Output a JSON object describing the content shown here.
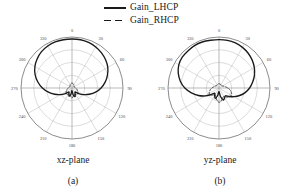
{
  "figure": {
    "legend": [
      {
        "label": "Gain_LHCP",
        "style": "solid",
        "color": "#1a1a1a",
        "key": "legend-solid-line"
      },
      {
        "label": "Gain_RHCP",
        "style": "dashed",
        "color": "#1a1a1a",
        "key": "legend-dashed-line"
      }
    ],
    "panels": [
      {
        "id": "a",
        "plane": "xz-plane",
        "index": "(a)"
      },
      {
        "id": "b",
        "plane": "yz-plane",
        "index": "(b)"
      }
    ]
  },
  "chart_data": [
    {
      "type": "line",
      "subtype": "polar",
      "title": "xz-plane",
      "panel": "(a)",
      "xlabel": "",
      "ylabel": "",
      "grid": true,
      "legend_position": "top-center",
      "angle_unit": "degrees",
      "angle_ticks": [
        0,
        30,
        60,
        90,
        120,
        150,
        180,
        210,
        240,
        270,
        300,
        330
      ],
      "angle_tick_labels": [
        "0",
        "30",
        "60",
        "90",
        "120",
        "150",
        "180",
        "210",
        "240",
        "270",
        "300",
        "330"
      ],
      "radial_rings": 4,
      "radial_range": [
        0,
        1
      ],
      "series": [
        {
          "name": "Gain_LHCP",
          "style": "solid",
          "color": "#1a1a1a",
          "angles": [
            0,
            10,
            20,
            30,
            40,
            50,
            60,
            70,
            80,
            90,
            100,
            110,
            120,
            130,
            140,
            150,
            160,
            170,
            180,
            190,
            200,
            210,
            220,
            230,
            240,
            250,
            260,
            270,
            280,
            290,
            300,
            310,
            320,
            330,
            340,
            350
          ],
          "values": [
            0.96,
            0.96,
            0.95,
            0.93,
            0.9,
            0.86,
            0.81,
            0.74,
            0.66,
            0.57,
            0.47,
            0.36,
            0.26,
            0.17,
            0.1,
            0.12,
            0.18,
            0.14,
            0.05,
            0.13,
            0.17,
            0.12,
            0.1,
            0.17,
            0.26,
            0.36,
            0.47,
            0.58,
            0.68,
            0.77,
            0.84,
            0.89,
            0.93,
            0.95,
            0.96,
            0.96
          ]
        },
        {
          "name": "Gain_RHCP",
          "style": "dashed",
          "color": "#2b2b2b",
          "angles": [
            0,
            10,
            20,
            30,
            40,
            50,
            60,
            70,
            80,
            90,
            100,
            110,
            120,
            130,
            140,
            150,
            160,
            170,
            180,
            190,
            200,
            210,
            220,
            230,
            240,
            250,
            260,
            270,
            280,
            290,
            300,
            310,
            320,
            330,
            340,
            350
          ],
          "values": [
            0.1,
            0.09,
            0.08,
            0.07,
            0.06,
            0.05,
            0.05,
            0.05,
            0.06,
            0.07,
            0.09,
            0.11,
            0.13,
            0.15,
            0.16,
            0.15,
            0.13,
            0.16,
            0.2,
            0.16,
            0.13,
            0.15,
            0.16,
            0.15,
            0.13,
            0.11,
            0.09,
            0.07,
            0.06,
            0.05,
            0.05,
            0.05,
            0.06,
            0.07,
            0.08,
            0.09
          ]
        }
      ]
    },
    {
      "type": "line",
      "subtype": "polar",
      "title": "yz-plane",
      "panel": "(b)",
      "xlabel": "",
      "ylabel": "",
      "grid": true,
      "legend_position": "top-center",
      "angle_unit": "degrees",
      "angle_ticks": [
        0,
        30,
        60,
        90,
        120,
        150,
        180,
        210,
        240,
        270,
        300,
        330
      ],
      "angle_tick_labels": [
        "0",
        "30",
        "60",
        "90",
        "120",
        "150",
        "180",
        "210",
        "240",
        "270",
        "300",
        "330"
      ],
      "radial_rings": 4,
      "radial_range": [
        0,
        1
      ],
      "series": [
        {
          "name": "Gain_LHCP",
          "style": "solid",
          "color": "#1a1a1a",
          "angles": [
            0,
            10,
            20,
            30,
            40,
            50,
            60,
            70,
            80,
            90,
            100,
            110,
            120,
            130,
            140,
            150,
            160,
            170,
            180,
            190,
            200,
            210,
            220,
            230,
            240,
            250,
            260,
            270,
            280,
            290,
            300,
            310,
            320,
            330,
            340,
            350
          ],
          "values": [
            0.95,
            0.95,
            0.94,
            0.92,
            0.89,
            0.85,
            0.8,
            0.74,
            0.67,
            0.6,
            0.52,
            0.43,
            0.34,
            0.26,
            0.2,
            0.22,
            0.25,
            0.17,
            0.07,
            0.15,
            0.22,
            0.17,
            0.13,
            0.2,
            0.31,
            0.43,
            0.55,
            0.67,
            0.77,
            0.85,
            0.91,
            0.94,
            0.95,
            0.96,
            0.96,
            0.95
          ]
        },
        {
          "name": "Gain_RHCP",
          "style": "dashed",
          "color": "#2b2b2b",
          "angles": [
            0,
            10,
            20,
            30,
            40,
            50,
            60,
            70,
            80,
            90,
            100,
            110,
            120,
            130,
            140,
            150,
            160,
            170,
            180,
            190,
            200,
            210,
            220,
            230,
            240,
            250,
            260,
            270,
            280,
            290,
            300,
            310,
            320,
            330,
            340,
            350
          ],
          "values": [
            0.09,
            0.08,
            0.08,
            0.07,
            0.07,
            0.07,
            0.08,
            0.1,
            0.13,
            0.17,
            0.22,
            0.26,
            0.28,
            0.27,
            0.23,
            0.19,
            0.21,
            0.26,
            0.28,
            0.24,
            0.18,
            0.15,
            0.18,
            0.21,
            0.22,
            0.2,
            0.17,
            0.14,
            0.11,
            0.09,
            0.08,
            0.07,
            0.07,
            0.07,
            0.08,
            0.08
          ]
        }
      ]
    }
  ]
}
